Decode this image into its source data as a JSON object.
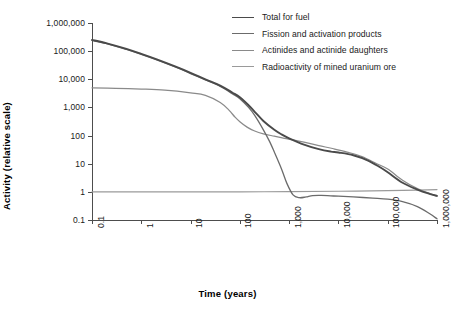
{
  "chart_data": {
    "type": "line",
    "title": "",
    "xlabel": "Time (years)",
    "ylabel": "Activity (relative scale)",
    "xscale": "log",
    "yscale": "log",
    "xlim": [
      0.1,
      1000000
    ],
    "ylim": [
      0.1,
      1000000
    ],
    "grid": false,
    "legend_position": "top-right",
    "xticklabels": [
      "0.1",
      "1",
      "10",
      "100",
      "1,000",
      "10,000",
      "100,000",
      "1,000,000"
    ],
    "xtickvalues": [
      0.1,
      1,
      10,
      100,
      1000,
      10000,
      100000,
      1000000
    ],
    "yticklabels": [
      "1,000,000",
      "100,000",
      "10,000",
      "1,000",
      "100",
      "10",
      "1",
      "0.1"
    ],
    "ytickvalues": [
      1000000,
      100000,
      10000,
      1000,
      100,
      10,
      1,
      0.1
    ],
    "series": [
      {
        "name": "Total for fuel",
        "color": "#4a4a4a",
        "width": 1.9,
        "x": [
          0.1,
          0.2,
          0.5,
          1,
          2,
          5,
          10,
          20,
          40,
          70,
          100,
          150,
          200,
          300,
          500,
          700,
          1000,
          2000,
          4000,
          7000,
          10000,
          20000,
          40000,
          70000,
          100000,
          200000,
          400000,
          700000,
          1000000
        ],
        "y": [
          250000,
          190000,
          120000,
          80000,
          52000,
          28000,
          17000,
          10000,
          6000,
          3400,
          2300,
          1200,
          700,
          330,
          160,
          110,
          80,
          48,
          33,
          27,
          25,
          20,
          13,
          7.5,
          5.0,
          2.1,
          1.2,
          0.85,
          0.72
        ]
      },
      {
        "name": "Fission and activation products",
        "color": "#6b6b6b",
        "width": 1.3,
        "x": [
          0.1,
          0.2,
          0.5,
          1,
          2,
          5,
          10,
          20,
          40,
          70,
          100,
          150,
          200,
          300,
          400,
          500,
          700,
          900,
          1200,
          1600,
          2200,
          3000,
          4500,
          7000,
          10000,
          20000,
          50000,
          100000,
          200000,
          400000,
          700000,
          1000000
        ],
        "y": [
          240000,
          185000,
          115000,
          77000,
          50000,
          27000,
          16000,
          9500,
          5600,
          3100,
          2050,
          1000,
          520,
          160,
          62,
          26,
          6.5,
          2.0,
          0.78,
          0.62,
          0.66,
          0.74,
          0.75,
          0.72,
          0.7,
          0.66,
          0.6,
          0.55,
          0.45,
          0.3,
          0.17,
          0.11
        ]
      },
      {
        "name": "Actinides and actinide daughters",
        "color": "#8a8a8a",
        "width": 1.25,
        "x": [
          0.1,
          0.3,
          1,
          3,
          10,
          20,
          40,
          60,
          80,
          100,
          140,
          200,
          300,
          500,
          800,
          1200,
          2000,
          4000,
          8000,
          15000,
          30000,
          60000,
          100000,
          200000,
          400000,
          700000,
          1000000
        ],
        "y": [
          5000,
          4800,
          4500,
          4100,
          3300,
          2700,
          1500,
          800,
          450,
          310,
          200,
          145,
          115,
          95,
          80,
          70,
          58,
          44,
          34,
          26,
          18,
          10,
          6.5,
          2.6,
          1.3,
          0.88,
          0.7
        ]
      },
      {
        "name": "Radioactivity of mined uranium ore",
        "color": "#9a9a9a",
        "width": 1.2,
        "x": [
          0.1,
          1,
          10,
          100,
          1000,
          10000,
          100000,
          400000,
          1000000
        ],
        "y": [
          1.0,
          1.0,
          1.0,
          1.0,
          1.02,
          1.05,
          1.1,
          1.16,
          1.2
        ]
      }
    ]
  },
  "legend": {
    "items": [
      {
        "label": "Total for fuel",
        "color": "#4a4a4a",
        "width": 1.9
      },
      {
        "label": "Fission and activation products",
        "color": "#6b6b6b",
        "width": 1.3
      },
      {
        "label": "Actinides and actinide daughters",
        "color": "#8a8a8a",
        "width": 1.25
      },
      {
        "label": "Radioactivity of mined uranium ore",
        "color": "#9a9a9a",
        "width": 1.2
      }
    ]
  },
  "axes": {
    "x_title": "Time (years)",
    "y_title": "Activity (relative scale)"
  }
}
